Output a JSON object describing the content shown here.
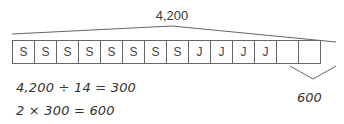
{
  "diagram": {
    "total_label": "4,200",
    "cells": [
      "S",
      "S",
      "S",
      "S",
      "S",
      "S",
      "S",
      "S",
      "J",
      "J",
      "J",
      "J",
      "",
      ""
    ],
    "part_label": "600",
    "equations": [
      "4,200 ÷ 14 = 300",
      "2 × 300 = 600"
    ],
    "colors": {
      "line": "#666666",
      "text": "#333333"
    }
  }
}
